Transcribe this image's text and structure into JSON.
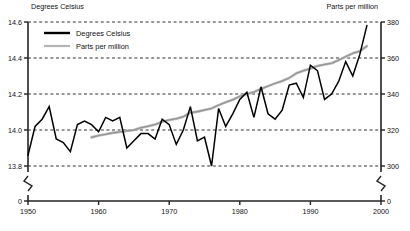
{
  "chart_data": {
    "type": "line",
    "title": "",
    "xlabel": "",
    "ylabel": "Degrees Celsius",
    "y2label": "Parts per million",
    "xlim": [
      1950,
      2000
    ],
    "ylim": [
      13.7,
      14.6
    ],
    "y2lim": [
      293,
      380
    ],
    "grid": true,
    "grid_style": "dashed-horizontal",
    "axis_break": true,
    "legend_position": "top-left-inside",
    "xticks": [
      1950,
      1960,
      1970,
      1980,
      1990,
      2000
    ],
    "xtick_labels": [
      "1950",
      "1960",
      "1970",
      "1980",
      "1990",
      "2000"
    ],
    "yticks": [
      13.8,
      14.0,
      14.2,
      14.4,
      14.6
    ],
    "ytick_labels": [
      "13.8",
      "14.0",
      "14.2",
      "14.4",
      "14.6"
    ],
    "y_zero_label": "0",
    "y2ticks": [
      300,
      320,
      340,
      360,
      380
    ],
    "y2tick_labels": [
      "300",
      "320",
      "340",
      "360",
      "380"
    ],
    "y2_zero_label": "0",
    "series": [
      {
        "name": "Degrees Celsius",
        "color": "#000000",
        "axis": "left",
        "width": 1.5,
        "x": [
          1950,
          1951,
          1952,
          1953,
          1954,
          1955,
          1956,
          1957,
          1958,
          1959,
          1960,
          1961,
          1962,
          1963,
          1964,
          1965,
          1966,
          1967,
          1968,
          1969,
          1970,
          1971,
          1972,
          1973,
          1974,
          1975,
          1976,
          1977,
          1978,
          1979,
          1980,
          1981,
          1982,
          1983,
          1984,
          1985,
          1986,
          1987,
          1988,
          1989,
          1990,
          1991,
          1992,
          1993,
          1994,
          1995,
          1996,
          1997,
          1998
        ],
        "values": [
          13.86,
          14.02,
          14.06,
          14.13,
          13.95,
          13.93,
          13.88,
          14.03,
          14.05,
          14.03,
          13.99,
          14.07,
          14.05,
          14.07,
          13.9,
          13.94,
          13.98,
          13.98,
          13.95,
          14.06,
          14.03,
          13.92,
          14.0,
          14.13,
          13.94,
          13.96,
          13.8,
          14.12,
          14.02,
          14.09,
          14.17,
          14.21,
          14.07,
          14.24,
          14.09,
          14.06,
          14.11,
          14.25,
          14.26,
          14.18,
          14.36,
          14.33,
          14.17,
          14.2,
          14.27,
          14.38,
          14.3,
          14.42,
          14.58
        ]
      },
      {
        "name": "Parts per million",
        "color": "#a8a8a8",
        "axis": "right",
        "width": 1.6,
        "x": [
          1959,
          1960,
          1961,
          1962,
          1963,
          1964,
          1965,
          1966,
          1967,
          1968,
          1969,
          1970,
          1971,
          1972,
          1973,
          1974,
          1975,
          1976,
          1977,
          1978,
          1979,
          1980,
          1981,
          1982,
          1983,
          1984,
          1985,
          1986,
          1987,
          1988,
          1989,
          1990,
          1991,
          1992,
          1993,
          1994,
          1995,
          1996,
          1997,
          1998
        ],
        "values": [
          315.9,
          316.9,
          317.6,
          318.4,
          318.9,
          319.5,
          320.0,
          321.3,
          322.1,
          323.0,
          324.6,
          325.6,
          326.3,
          327.4,
          329.6,
          330.2,
          331.1,
          332.0,
          333.8,
          335.4,
          336.8,
          338.7,
          340.0,
          341.1,
          342.8,
          344.4,
          345.9,
          347.2,
          348.9,
          351.5,
          352.9,
          354.2,
          355.6,
          356.4,
          357.1,
          358.8,
          360.8,
          362.6,
          363.8,
          366.6
        ]
      }
    ],
    "legend": [
      {
        "label": "Degrees Celsius",
        "color": "#000000",
        "style": "thick-solid"
      },
      {
        "label": "Parts per million",
        "color": "#b0b0b0",
        "style": "thin-solid"
      }
    ]
  }
}
